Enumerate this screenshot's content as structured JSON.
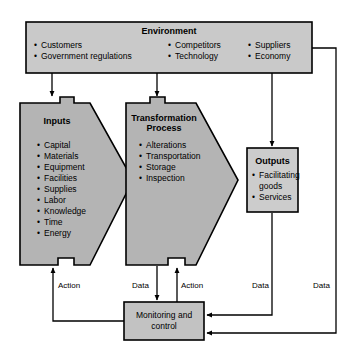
{
  "diagram": {
    "colors": {
      "environment_fill": "#c9c9c9",
      "process_fill": "#b4b4b4",
      "outputs_fill": "#cccccc",
      "monitoring_fill": "#c2c2c2",
      "stroke": "#000000",
      "background": "#ffffff"
    },
    "environment": {
      "title": "Environment",
      "columns": [
        {
          "items": [
            "Customers",
            "Government regulations"
          ]
        },
        {
          "items": [
            "Competitors",
            "Technology"
          ]
        },
        {
          "items": [
            "Suppliers",
            "Economy"
          ]
        }
      ]
    },
    "inputs": {
      "title": "Inputs",
      "items": [
        "Capital",
        "Materials",
        "Equipment",
        "Facilities",
        "Supplies",
        "Labor",
        "Knowledge",
        "Time",
        "Energy"
      ]
    },
    "transformation": {
      "title_line1": "Transformation",
      "title_line2": "Process",
      "items": [
        "Alterations",
        "Transportation",
        "Storage",
        "Inspection"
      ]
    },
    "outputs": {
      "title": "Outputs",
      "items": [
        "Facilitating",
        "goods",
        "Services"
      ]
    },
    "monitoring": {
      "line1": "Monitoring and",
      "line2": "control"
    },
    "edge_labels": {
      "action_left": "Action",
      "data_center": "Data",
      "action_center": "Action",
      "data_outputs": "Data",
      "data_environment": "Data"
    },
    "bullet_glyph": "•"
  }
}
